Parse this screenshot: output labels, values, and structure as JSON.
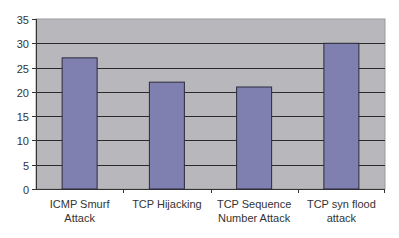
{
  "chart_data": {
    "type": "bar",
    "title": "",
    "xlabel": "",
    "ylabel": "",
    "categories": [
      "ICMP Smurf Attack",
      "TCP Hijacking",
      "TCP Sequence Number Attack",
      "TCP syn flood attack"
    ],
    "category_lines": [
      [
        "ICMP Smurf",
        "Attack"
      ],
      [
        "TCP Hijacking"
      ],
      [
        "TCP Sequence",
        "Number Attack"
      ],
      [
        "TCP syn flood",
        "attack"
      ]
    ],
    "values": [
      27,
      22,
      21,
      30
    ],
    "ylim": [
      0,
      35
    ],
    "yticks": [
      0,
      5,
      10,
      15,
      20,
      25,
      30,
      35
    ],
    "grid": true,
    "legend": "none",
    "colors": {
      "bar_fill": "#8080b0",
      "bar_edge": "#2a2a3a",
      "plot_bg": "#b8b8bc",
      "grid": "#2b2b2b"
    }
  }
}
